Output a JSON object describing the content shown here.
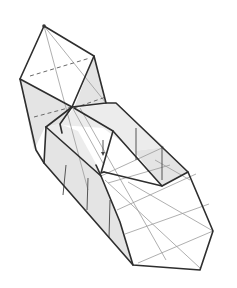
{
  "figure": {
    "colors": {
      "edge": "#2e2e2e",
      "crease": "#9a9a9a",
      "shade": "#e4e4e4",
      "background": "#ffffff"
    }
  }
}
